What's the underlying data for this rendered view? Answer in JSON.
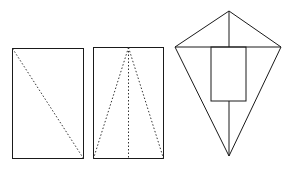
{
  "figures": [
    {
      "name": "rectangle-with-diagonal",
      "rect": {
        "x": 12,
        "y": 48,
        "w": 71,
        "h": 110
      },
      "folds": [
        {
          "x1": 12,
          "y1": 48,
          "x2": 83,
          "y2": 158
        }
      ]
    },
    {
      "name": "rectangle-with-fold-lines",
      "rect": {
        "x": 93,
        "y": 47,
        "w": 70,
        "h": 111
      },
      "folds": [
        {
          "x1": 128,
          "y1": 47,
          "x2": 93,
          "y2": 158
        },
        {
          "x1": 128,
          "y1": 47,
          "x2": 128,
          "y2": 158
        },
        {
          "x1": 128,
          "y1": 47,
          "x2": 163,
          "y2": 158
        }
      ]
    },
    {
      "name": "kite",
      "vertices": {
        "top": [
          229,
          11
        ],
        "left": [
          175,
          47
        ],
        "right": [
          281,
          47
        ],
        "bottom": [
          229,
          156
        ]
      },
      "inner_rect": {
        "x": 211,
        "y": 47,
        "w": 35,
        "h": 54
      }
    }
  ],
  "colors": {
    "stroke": "#1a1a1a",
    "background": "#ffffff"
  }
}
